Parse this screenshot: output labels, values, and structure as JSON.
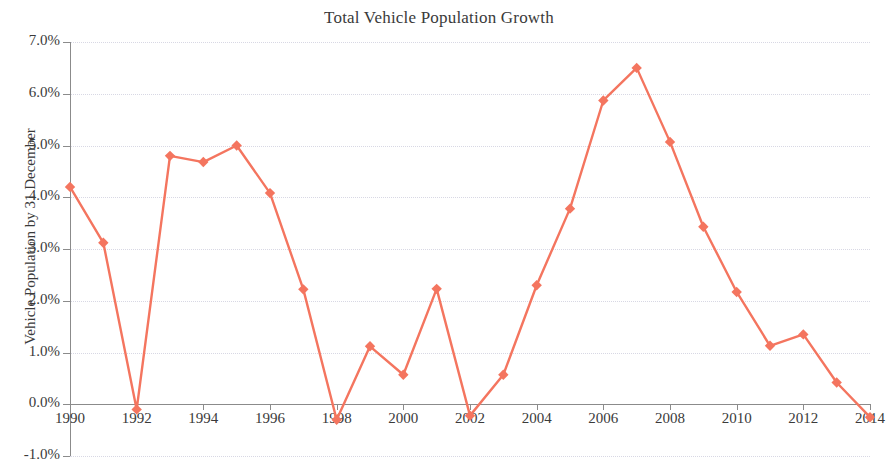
{
  "chart_data": {
    "type": "line",
    "title": "Total Vehicle Population Growth",
    "xlabel": "",
    "ylabel": "Vehicle Population by 31 December",
    "series_color": "#F4755F",
    "marker": "diamond",
    "grid": true,
    "legend": "none",
    "xlim": [
      1990,
      2014
    ],
    "ylim": [
      -1.0,
      7.0
    ],
    "y_tick_labels": [
      "7.0%",
      "6.0%",
      "5.0%",
      "4.0%",
      "3.0%",
      "2.0%",
      "1.0%",
      "0.0%",
      "-1.0%"
    ],
    "y_tick_values": [
      7.0,
      6.0,
      5.0,
      4.0,
      3.0,
      2.0,
      1.0,
      0.0,
      -1.0
    ],
    "x_tick_labels": [
      "1990",
      "1992",
      "1994",
      "1996",
      "1998",
      "2000",
      "2002",
      "2004",
      "2006",
      "2008",
      "2010",
      "2012",
      "2014"
    ],
    "x_tick_values": [
      1990,
      1992,
      1994,
      1996,
      1998,
      2000,
      2002,
      2004,
      2006,
      2008,
      2010,
      2012,
      2014
    ],
    "x": [
      1990,
      1991,
      1992,
      1993,
      1994,
      1995,
      1996,
      1997,
      1998,
      1999,
      2000,
      2001,
      2002,
      2003,
      2004,
      2005,
      2006,
      2007,
      2008,
      2009,
      2010,
      2011,
      2012,
      2013,
      2014
    ],
    "values": [
      4.2,
      3.12,
      -0.1,
      4.8,
      4.68,
      5.0,
      4.08,
      2.22,
      -0.3,
      1.12,
      0.57,
      2.23,
      -0.22,
      0.57,
      2.3,
      3.78,
      5.87,
      6.5,
      5.07,
      3.43,
      2.17,
      1.13,
      1.35,
      0.42,
      -0.25
    ],
    "units": "percent"
  }
}
